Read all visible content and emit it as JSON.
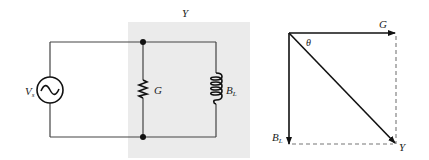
{
  "circuit": {
    "source_label": "V",
    "source_subscript": "s",
    "admittance_label": "Y",
    "conductance_label": "G",
    "susceptance_label": "B",
    "susceptance_subscript": "L",
    "shade_color": "#ebebeb",
    "wire_color": "#444444"
  },
  "phasor": {
    "g_label": "G",
    "bl_label": "B",
    "bl_subscript": "L",
    "y_label": "Y",
    "angle_label": "θ",
    "line_color": "#111111",
    "dash_color": "#777777"
  }
}
